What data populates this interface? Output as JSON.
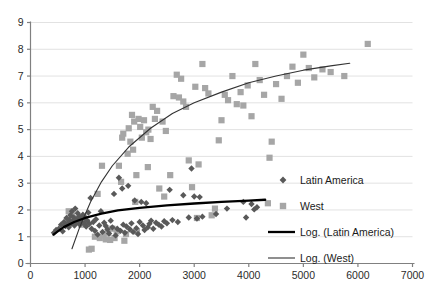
{
  "chart_data": {
    "type": "scatter",
    "title": "",
    "subtitle": "",
    "xlabel": "",
    "ylabel": "",
    "xlim": [
      0,
      7000
    ],
    "ylim": [
      0,
      9
    ],
    "xticks": [
      0,
      1000,
      2000,
      3000,
      4000,
      5000,
      6000,
      7000
    ],
    "yticks": [
      0,
      1,
      2,
      3,
      4,
      5,
      6,
      7,
      8,
      9
    ],
    "grid": "horizontal",
    "legend_position": "right-middle",
    "colors": {
      "latin_america": "#595959",
      "west": "#a6a6a6",
      "trend_latin_america": "#000000",
      "trend_west": "#404040",
      "gridline": "#e2e2e2",
      "axis": "#808080"
    },
    "series": [
      {
        "name": "Latin America",
        "marker": "diamond",
        "color": "#595959",
        "points": [
          [
            430,
            1.15
          ],
          [
            470,
            1.25
          ],
          [
            520,
            1.3
          ],
          [
            560,
            1.45
          ],
          [
            590,
            1.2
          ],
          [
            615,
            1.55
          ],
          [
            640,
            1.4
          ],
          [
            660,
            1.7
          ],
          [
            680,
            1.5
          ],
          [
            700,
            1.35
          ],
          [
            715,
            1.62
          ],
          [
            730,
            1.8
          ],
          [
            745,
            1.48
          ],
          [
            760,
            1.95
          ],
          [
            775,
            1.58
          ],
          [
            790,
            1.72
          ],
          [
            805,
            1.42
          ],
          [
            820,
            2.05
          ],
          [
            835,
            1.65
          ],
          [
            850,
            1.52
          ],
          [
            865,
            1.88
          ],
          [
            880,
            1.6
          ],
          [
            895,
            1.75
          ],
          [
            910,
            1.45
          ],
          [
            925,
            1.68
          ],
          [
            940,
            1.55
          ],
          [
            960,
            1.82
          ],
          [
            980,
            1.5
          ],
          [
            1000,
            1.7
          ],
          [
            1020,
            1.38
          ],
          [
            1040,
            1.6
          ],
          [
            1060,
            1.9
          ],
          [
            1080,
            1.48
          ],
          [
            1100,
            2.45
          ],
          [
            1120,
            1.3
          ],
          [
            1150,
            1.55
          ],
          [
            1180,
            1.22
          ],
          [
            1200,
            1.65
          ],
          [
            1230,
            1.08
          ],
          [
            1260,
            1.42
          ],
          [
            1290,
            1.95
          ],
          [
            1320,
            1.18
          ],
          [
            1350,
            1.52
          ],
          [
            1380,
            1.4
          ],
          [
            1410,
            1.28
          ],
          [
            1440,
            1.12
          ],
          [
            1470,
            1.6
          ],
          [
            1500,
            1.35
          ],
          [
            1530,
            2.6
          ],
          [
            1560,
            1.05
          ],
          [
            1590,
            1.3
          ],
          [
            1620,
            3.2
          ],
          [
            1650,
            1.22
          ],
          [
            1680,
            2.8
          ],
          [
            1700,
            1.45
          ],
          [
            1730,
            1.15
          ],
          [
            1760,
            1.38
          ],
          [
            1790,
            2.9
          ],
          [
            1820,
            1.28
          ],
          [
            1850,
            1.5
          ],
          [
            1880,
            1.18
          ],
          [
            1910,
            2.35
          ],
          [
            1940,
            1.32
          ],
          [
            1970,
            1.1
          ],
          [
            2000,
            1.55
          ],
          [
            2030,
            2.3
          ],
          [
            2060,
            1.42
          ],
          [
            2090,
            1.25
          ],
          [
            2120,
            2.25
          ],
          [
            2150,
            1.35
          ],
          [
            2180,
            1.48
          ],
          [
            2210,
            1.6
          ],
          [
            2250,
            1.3
          ],
          [
            2300,
            1.52
          ],
          [
            2350,
            1.45
          ],
          [
            2400,
            1.38
          ],
          [
            2450,
            1.58
          ],
          [
            2500,
            1.5
          ],
          [
            2550,
            2.75
          ],
          [
            2600,
            1.62
          ],
          [
            2700,
            1.55
          ],
          [
            2800,
            2.55
          ],
          [
            2900,
            1.72
          ],
          [
            2950,
            3.55
          ],
          [
            3000,
            2.5
          ],
          [
            3050,
            1.68
          ],
          [
            3100,
            2.48
          ],
          [
            3150,
            1.75
          ],
          [
            3400,
            1.85
          ],
          [
            3600,
            2.05
          ],
          [
            3900,
            2.3
          ],
          [
            4050,
            2.22
          ],
          [
            4100,
            2.02
          ],
          [
            4150,
            2.1
          ],
          [
            3950,
            1.72
          ]
        ]
      },
      {
        "name": "West",
        "marker": "square",
        "color": "#a6a6a6",
        "points": [
          [
            700,
            1.95
          ],
          [
            760,
            1.8
          ],
          [
            820,
            1.7
          ],
          [
            880,
            1.6
          ],
          [
            930,
            1.45
          ],
          [
            980,
            1.72
          ],
          [
            1030,
            1.55
          ],
          [
            1070,
            0.52
          ],
          [
            1120,
            0.55
          ],
          [
            1180,
            1.0
          ],
          [
            1230,
            2.6
          ],
          [
            1270,
            0.95
          ],
          [
            1310,
            3.65
          ],
          [
            1340,
            1.05
          ],
          [
            1380,
            0.9
          ],
          [
            1420,
            1.15
          ],
          [
            1460,
            0.88
          ],
          [
            1500,
            1.3
          ],
          [
            1540,
            0.95
          ],
          [
            1580,
            1.2
          ],
          [
            1620,
            3.65
          ],
          [
            1660,
            3.05
          ],
          [
            1680,
            4.7
          ],
          [
            1700,
            4.85
          ],
          [
            1720,
            0.85
          ],
          [
            1750,
            1.1
          ],
          [
            1780,
            4.1
          ],
          [
            1800,
            5.05
          ],
          [
            1830,
            4.55
          ],
          [
            1860,
            5.55
          ],
          [
            1880,
            4.25
          ],
          [
            1900,
            5.3
          ],
          [
            1920,
            2.3
          ],
          [
            1950,
            1.2
          ],
          [
            1980,
            5.4
          ],
          [
            2010,
            5.1
          ],
          [
            2040,
            4.7
          ],
          [
            2080,
            5.35
          ],
          [
            2120,
            4.9
          ],
          [
            2160,
            5.0
          ],
          [
            2200,
            4.65
          ],
          [
            2240,
            5.85
          ],
          [
            2280,
            5.4
          ],
          [
            2320,
            5.7
          ],
          [
            2360,
            2.8
          ],
          [
            2420,
            5.3
          ],
          [
            2480,
            4.95
          ],
          [
            2560,
            3.3
          ],
          [
            2620,
            6.25
          ],
          [
            2680,
            7.05
          ],
          [
            2720,
            6.2
          ],
          [
            2760,
            6.9
          ],
          [
            2800,
            6.05
          ],
          [
            2850,
            5.85
          ],
          [
            2900,
            3.85
          ],
          [
            2960,
            2.85
          ],
          [
            3020,
            6.6
          ],
          [
            3080,
            3.7
          ],
          [
            3150,
            7.45
          ],
          [
            3200,
            6.55
          ],
          [
            3260,
            6.35
          ],
          [
            3320,
            1.8
          ],
          [
            3380,
            2.05
          ],
          [
            3450,
            4.6
          ],
          [
            3500,
            5.35
          ],
          [
            3560,
            6.3
          ],
          [
            3620,
            6.1
          ],
          [
            3700,
            7.0
          ],
          [
            3780,
            5.95
          ],
          [
            3850,
            6.4
          ],
          [
            3900,
            5.9
          ],
          [
            3980,
            6.65
          ],
          [
            4050,
            5.5
          ],
          [
            4120,
            7.45
          ],
          [
            4200,
            6.85
          ],
          [
            4280,
            6.3
          ],
          [
            4350,
            2.25
          ],
          [
            4420,
            4.55
          ],
          [
            4500,
            6.7
          ],
          [
            4600,
            6.15
          ],
          [
            4700,
            7.0
          ],
          [
            4800,
            7.35
          ],
          [
            4900,
            6.75
          ],
          [
            5000,
            7.8
          ],
          [
            5100,
            7.3
          ],
          [
            5200,
            6.95
          ],
          [
            5350,
            7.25
          ],
          [
            5500,
            7.15
          ],
          [
            5750,
            7.0
          ],
          [
            6180,
            8.2
          ],
          [
            3050,
            1.7
          ],
          [
            4380,
            3.95
          ],
          [
            2450,
            2.5
          ],
          [
            2150,
            3.6
          ],
          [
            1940,
            3.3
          ]
        ]
      }
    ],
    "trendlines": [
      {
        "name": "Log. (Latin America)",
        "style": "thick",
        "color": "#000000",
        "formula": "logarithmic",
        "points": [
          [
            420,
            1.08
          ],
          [
            600,
            1.35
          ],
          [
            800,
            1.55
          ],
          [
            1000,
            1.7
          ],
          [
            1300,
            1.86
          ],
          [
            1600,
            1.98
          ],
          [
            2000,
            2.08
          ],
          [
            2500,
            2.17
          ],
          [
            3000,
            2.24
          ],
          [
            3500,
            2.3
          ],
          [
            4000,
            2.35
          ],
          [
            4300,
            2.38
          ]
        ]
      },
      {
        "name": "Log. (West)",
        "style": "thin",
        "color": "#333333",
        "formula": "logarithmic",
        "points": [
          [
            760,
            0.55
          ],
          [
            900,
            1.35
          ],
          [
            1100,
            2.3
          ],
          [
            1300,
            3.05
          ],
          [
            1500,
            3.65
          ],
          [
            1800,
            4.35
          ],
          [
            2200,
            5.05
          ],
          [
            2600,
            5.6
          ],
          [
            3000,
            6.0
          ],
          [
            3500,
            6.4
          ],
          [
            4000,
            6.75
          ],
          [
            4500,
            7.0
          ],
          [
            5000,
            7.22
          ],
          [
            5500,
            7.38
          ],
          [
            5850,
            7.48
          ]
        ]
      }
    ],
    "legend": [
      {
        "label": "Latin America",
        "marker": "diamond",
        "color": "#595959"
      },
      {
        "label": "West",
        "marker": "square",
        "color": "#a6a6a6"
      },
      {
        "label": "Log. (Latin America)",
        "marker": "line-thick",
        "color": "#000000"
      },
      {
        "label": "Log. (West)",
        "marker": "line-thin",
        "color": "#333333"
      }
    ]
  }
}
